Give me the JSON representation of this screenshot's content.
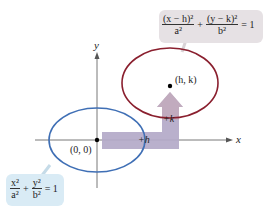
{
  "diagram": {
    "axes": {
      "x_label": "x",
      "y_label": "y"
    },
    "origin_label": "(0, 0)",
    "center_label": "(h, k)",
    "shift_labels": {
      "horizontal": "+h",
      "vertical": "+k"
    },
    "equations": {
      "standard": {
        "term1_num": "x²",
        "term1_den": "a²",
        "plus": "+",
        "term2_num": "y²",
        "term2_den": "b²",
        "rhs": "= 1"
      },
      "translated": {
        "term1_num": "(x − h)²",
        "term1_den": "a²",
        "plus": "+",
        "term2_num": "(y − k)²",
        "term2_den": "b²",
        "rhs": "= 1"
      }
    },
    "colors": {
      "original_ellipse": "#3f6fb5",
      "translated_ellipse": "#8a1f2e",
      "shift_arrow": "#b3a9c8",
      "standard_box": "#d9ebf5",
      "translated_box": "#e6e1e4",
      "axes": "#555555"
    }
  }
}
